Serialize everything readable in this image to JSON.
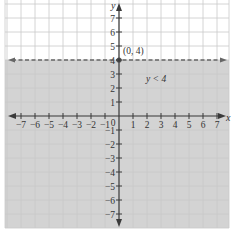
{
  "chart_data": {
    "type": "line",
    "title": "",
    "xlabel": "x",
    "ylabel": "y",
    "xlim": [
      -7,
      7
    ],
    "ylim": [
      -7,
      7
    ],
    "grid": true,
    "x_ticks": [
      -7,
      -6,
      -5,
      -4,
      -3,
      -2,
      -1,
      0,
      1,
      2,
      3,
      4,
      5,
      6,
      7
    ],
    "y_ticks": [
      -7,
      -6,
      -5,
      -4,
      -3,
      -2,
      -1,
      1,
      2,
      3,
      4,
      5,
      6,
      7
    ],
    "x_tick_labels": [
      "−7",
      "−6",
      "−5",
      "−4",
      "−3",
      "−2",
      "−1",
      "0",
      "1",
      "2",
      "3",
      "4",
      "5",
      "6",
      "7"
    ],
    "y_tick_labels": [
      "−7",
      "−6",
      "−5",
      "−4",
      "−3",
      "−2",
      "−1",
      "1",
      "2",
      "3",
      "4",
      "5",
      "6",
      "7"
    ],
    "boundary_line": {
      "equation": "y = 4",
      "style": "dashed",
      "y": 4
    },
    "shaded_region": {
      "inequality": "y < 4",
      "from_y": -7.5,
      "to_y": 4
    },
    "points": [
      {
        "x": 0,
        "y": 4,
        "label": "(0, 4)"
      }
    ],
    "annotations": [
      {
        "text": "y < 4",
        "x": 2.6,
        "y": 2.7
      }
    ]
  },
  "labels": {
    "x_axis": "x",
    "y_axis": "y",
    "point": "(0, 4)",
    "region": "y < 4",
    "origin": "0"
  },
  "colors": {
    "shade": "#d3d3d3",
    "grid": "#c9c9c9",
    "axis": "#3a3a3a",
    "dashed": "#666666",
    "point": "#555555"
  }
}
